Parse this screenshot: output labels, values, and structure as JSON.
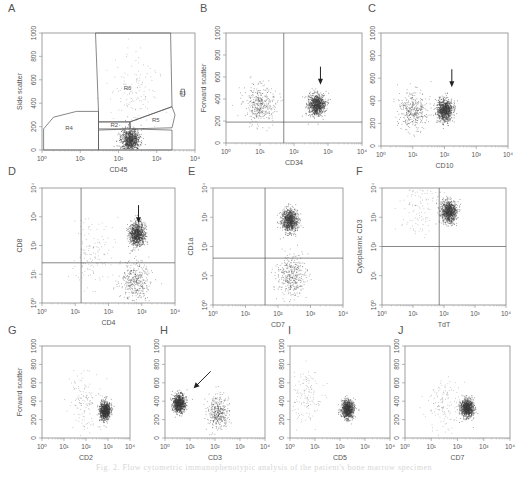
{
  "figure": {
    "caption": "Fig. 2. Flow cytometric immunophenotypic analysis of the patient's bone marrow specimen",
    "dot_color": "#3a3a3a",
    "line_color": "#555555"
  },
  "chart_data": [
    {
      "panel": "A",
      "type": "scatter",
      "xlabel": "CD45",
      "ylabel": "Side scatter",
      "xscale": "log",
      "xlim": [
        1,
        10000
      ],
      "xticks": [
        "10⁰",
        "10¹",
        "10²",
        "10³",
        "10⁴"
      ],
      "yscale": "linear",
      "ylim": [
        0,
        1000
      ],
      "yticks": [
        "0",
        "200",
        "400",
        "600",
        "800",
        "1000"
      ],
      "gates": [
        {
          "name": "R1",
          "polygon": [
            [
              30,
              0
            ],
            [
              2500,
              0
            ],
            [
              2500,
              170
            ],
            [
              200,
              180
            ],
            [
              30,
              170
            ]
          ]
        },
        {
          "name": "R2",
          "polygon": [
            [
              30,
              180
            ],
            [
              200,
              180
            ],
            [
              200,
              240
            ],
            [
              30,
              240
            ]
          ]
        },
        {
          "name": "R4",
          "polygon": [
            [
              1.1,
              0
            ],
            [
              30,
              0
            ],
            [
              30,
              330
            ],
            [
              8,
              330
            ],
            [
              2,
              280
            ],
            [
              1.1,
              180
            ]
          ]
        },
        {
          "name": "R5",
          "polygon": [
            [
              200,
              180
            ],
            [
              2500,
              190
            ],
            [
              3000,
              300
            ],
            [
              2500,
              370
            ],
            [
              200,
              240
            ]
          ]
        },
        {
          "name": "R6",
          "polygon": [
            [
              25,
              1000
            ],
            [
              2300,
              1000
            ],
            [
              2500,
              370
            ],
            [
              200,
              240
            ],
            [
              30,
              240
            ],
            [
              30,
              330
            ]
          ]
        },
        {
          "name": "R3",
          "polygon": [
            [
              4300,
              460
            ],
            [
              5300,
              460
            ],
            [
              5300,
              520
            ],
            [
              4300,
              520
            ]
          ]
        }
      ],
      "populations": [
        {
          "label": "blasts (R1)",
          "x_center_log10": 2.3,
          "y_center": 90,
          "density": "high"
        },
        {
          "label": "R6 scatter",
          "x_center_log10": 2.4,
          "y_center": 500,
          "density": "sparse"
        }
      ]
    },
    {
      "panel": "B",
      "type": "scatter",
      "xlabel": "CD34",
      "ylabel": "Forward scatter",
      "xscale": "log",
      "xlim": [
        1,
        10000
      ],
      "xticks": [
        "10⁰",
        "10¹",
        "10²",
        "10³",
        "10⁴"
      ],
      "yscale": "linear",
      "ylim": [
        0,
        1000
      ],
      "yticks": [
        "0",
        "200",
        "400",
        "600",
        "800",
        "1000"
      ],
      "quadrant": {
        "x": 50,
        "y": 190
      },
      "arrow": {
        "x": 600,
        "y_tip": 530
      },
      "populations": [
        {
          "label": "CD34- cells",
          "x_center_log10": 1.0,
          "y_center": 360,
          "density": "medium"
        },
        {
          "label": "CD34+ blasts",
          "x_center_log10": 2.65,
          "y_center": 350,
          "density": "high"
        }
      ]
    },
    {
      "panel": "C",
      "type": "scatter",
      "xlabel": "CD10",
      "ylabel": "",
      "xscale": "log",
      "xlim": [
        1,
        10000
      ],
      "xticks": [
        "10⁰",
        "10¹",
        "10²",
        "10³",
        "10⁴"
      ],
      "yscale": "linear",
      "ylim": [
        0,
        1000
      ],
      "yticks": [
        "0",
        "200",
        "400",
        "600",
        "800",
        "1000"
      ],
      "arrow": {
        "x": 170,
        "y_tip": 520
      },
      "populations": [
        {
          "label": "CD10 dim blasts",
          "x_center_log10": 2.0,
          "y_center": 320,
          "density": "high"
        },
        {
          "label": "left tail",
          "x_center_log10": 1.0,
          "y_center": 320,
          "density": "medium"
        }
      ]
    },
    {
      "panel": "D",
      "type": "scatter",
      "xlabel": "CD4",
      "ylabel": "CD8",
      "xscale": "log",
      "xlim": [
        1,
        10000
      ],
      "xticks": [
        "10⁰",
        "10¹",
        "10²",
        "10³",
        "10⁴"
      ],
      "yscale": "log",
      "ylim": [
        1,
        10000
      ],
      "yticks": [
        "10⁰",
        "10¹",
        "10²",
        "10³",
        "10⁴"
      ],
      "quadrant": {
        "x": 15,
        "y": 25
      },
      "arrow": {
        "x": 800,
        "y_tip": 600
      },
      "populations": [
        {
          "label": "CD4+CD8+ blasts",
          "x_center_log10": 2.85,
          "y_center_log10": 2.4,
          "density": "high"
        },
        {
          "label": "CD4+CD8- stream",
          "x_center_log10": 2.8,
          "y_center_log10": 0.8,
          "density": "medium"
        },
        {
          "label": "diffuse",
          "x_center_log10": 1.5,
          "y_center_log10": 1.8,
          "density": "sparse"
        }
      ]
    },
    {
      "panel": "E",
      "type": "scatter",
      "xlabel": "CD7",
      "ylabel": "CD1a",
      "xscale": "log",
      "xlim": [
        1,
        10000
      ],
      "xticks": [
        "10⁰",
        "10¹",
        "10²",
        "10³",
        "10⁴"
      ],
      "yscale": "log",
      "ylim": [
        1,
        10000
      ],
      "yticks": [
        "10⁰",
        "10¹",
        "10²",
        "10³",
        "10⁴"
      ],
      "quadrant": {
        "x": 40,
        "y": 40
      },
      "populations": [
        {
          "label": "CD7+CD1a+",
          "x_center_log10": 2.35,
          "y_center_log10": 2.9,
          "density": "high"
        },
        {
          "label": "CD7+CD1a-",
          "x_center_log10": 2.4,
          "y_center_log10": 1.0,
          "density": "medium"
        }
      ]
    },
    {
      "panel": "F",
      "type": "scatter",
      "xlabel": "TdT",
      "ylabel": "Cytoplasmic CD3",
      "xscale": "log",
      "xlim": [
        1,
        10000
      ],
      "xticks": [
        "10⁰",
        "10¹",
        "10²",
        "10³",
        "10⁴"
      ],
      "yscale": "log",
      "ylim": [
        1,
        10000
      ],
      "yticks": [
        "10⁰",
        "10¹",
        "10²",
        "10³",
        "10⁴"
      ],
      "quadrant": {
        "x": 70,
        "y": 100
      },
      "populations": [
        {
          "label": "TdT+ cCD3+",
          "x_center_log10": 2.15,
          "y_center_log10": 3.2,
          "density": "high"
        },
        {
          "label": "cCD3+ TdT- tail",
          "x_center_log10": 1.2,
          "y_center_log10": 3.5,
          "density": "sparse"
        }
      ]
    },
    {
      "panel": "G",
      "type": "scatter",
      "xlabel": "CD2",
      "ylabel": "Forward scatter",
      "xscale": "log",
      "xlim": [
        1,
        10000
      ],
      "xticks": [
        "10⁰",
        "10¹",
        "10²",
        "10³",
        "10⁴"
      ],
      "yscale": "linear",
      "ylim": [
        0,
        1000
      ],
      "yticks": [
        "0",
        "200",
        "400",
        "600",
        "800",
        "1000"
      ],
      "populations": [
        {
          "label": "CD2+",
          "x_center_log10": 2.85,
          "y_center": 300,
          "density": "high"
        },
        {
          "label": "CD2-",
          "x_center_log10": 1.9,
          "y_center": 400,
          "density": "sparse"
        }
      ]
    },
    {
      "panel": "H",
      "type": "scatter",
      "xlabel": "CD3",
      "ylabel": "",
      "xscale": "log",
      "xlim": [
        1,
        10000
      ],
      "xticks": [
        "10⁰",
        "10¹",
        "10²",
        "10³",
        "10⁴"
      ],
      "yscale": "linear",
      "ylim": [
        0,
        1000
      ],
      "yticks": [
        "0",
        "200",
        "400",
        "600",
        "800",
        "1000"
      ],
      "arrow": {
        "x": 14,
        "y_tip": 540
      },
      "populations": [
        {
          "label": "surface CD3- blasts",
          "x_center_log10": 0.55,
          "y_center": 380,
          "density": "high"
        },
        {
          "label": "CD3+ cells",
          "x_center_log10": 2.1,
          "y_center": 280,
          "density": "medium"
        }
      ]
    },
    {
      "panel": "I",
      "type": "scatter",
      "xlabel": "CD5",
      "ylabel": "",
      "xscale": "log",
      "xlim": [
        1,
        10000
      ],
      "xticks": [
        "10⁰",
        "10¹",
        "10²",
        "10³",
        "10⁴"
      ],
      "yscale": "linear",
      "ylim": [
        0,
        1000
      ],
      "yticks": [
        "0",
        "200",
        "400",
        "600",
        "800",
        "1000"
      ],
      "populations": [
        {
          "label": "CD5+",
          "x_center_log10": 2.3,
          "y_center": 320,
          "density": "high"
        },
        {
          "label": "CD5-",
          "x_center_log10": 0.6,
          "y_center": 430,
          "density": "sparse"
        }
      ]
    },
    {
      "panel": "J",
      "type": "scatter",
      "xlabel": "CD7",
      "ylabel": "",
      "xscale": "log",
      "xlim": [
        1,
        10000
      ],
      "xticks": [
        "10⁰",
        "10¹",
        "10²",
        "10³",
        "10⁴"
      ],
      "yscale": "linear",
      "ylim": [
        0,
        1000
      ],
      "yticks": [
        "0",
        "200",
        "400",
        "600",
        "800",
        "1000"
      ],
      "populations": [
        {
          "label": "CD7+",
          "x_center_log10": 2.35,
          "y_center": 330,
          "density": "high"
        },
        {
          "label": "CD7 dim",
          "x_center_log10": 1.5,
          "y_center": 360,
          "density": "sparse"
        }
      ]
    }
  ]
}
